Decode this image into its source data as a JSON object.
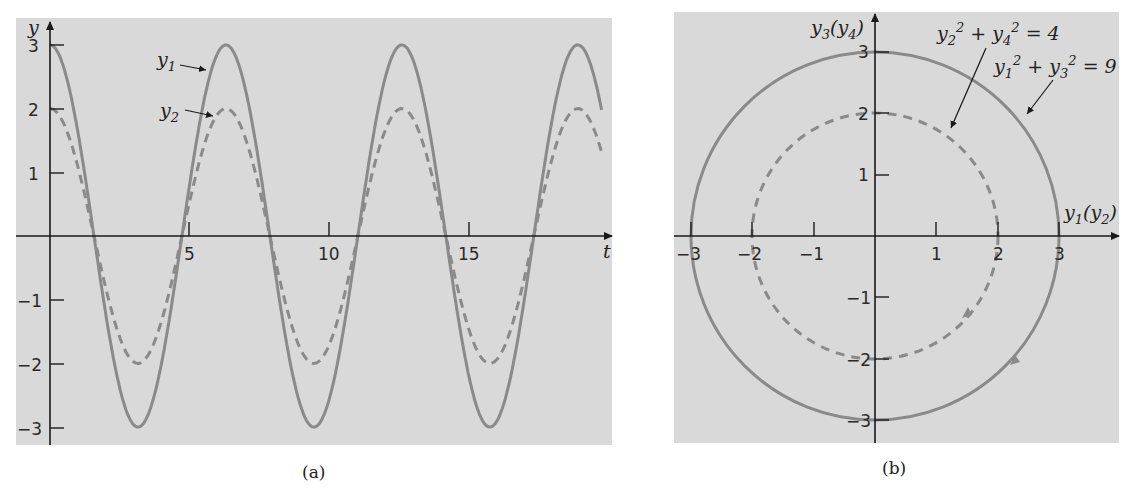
{
  "figure": {
    "captions": {
      "a": "(a)",
      "b": "(b)"
    },
    "colors": {
      "background": "#d9d9d9",
      "curve": "#8a8a8a",
      "axis": "#1a1a1a",
      "text": "#222222"
    }
  },
  "chart_data": [
    {
      "type": "line",
      "panel": "a",
      "title": "",
      "xlabel": "t",
      "ylabel": "y",
      "xlim": [
        0,
        19.7
      ],
      "ylim": [
        -3,
        3
      ],
      "x_ticks": [
        5,
        10,
        15
      ],
      "y_ticks": [
        -3,
        -2,
        -1,
        1,
        2,
        3
      ],
      "grid": false,
      "series": [
        {
          "name": "y1",
          "style": "solid",
          "formula": "3cos(t)",
          "amplitude": 3,
          "x": [
            0,
            1.571,
            3.142,
            4.712,
            6.283,
            7.854,
            9.425,
            10.996,
            12.566,
            14.137,
            15.708,
            17.279,
            18.85
          ],
          "values": [
            3,
            0,
            -3,
            0,
            3,
            0,
            -3,
            0,
            3,
            0,
            -3,
            0,
            3
          ]
        },
        {
          "name": "y2",
          "style": "dashed",
          "formula": "2cos(t)",
          "amplitude": 2,
          "x": [
            0,
            1.571,
            3.142,
            4.712,
            6.283,
            7.854,
            9.425,
            10.996,
            12.566,
            14.137,
            15.708,
            17.279,
            18.85
          ],
          "values": [
            2,
            0,
            -2,
            0,
            2,
            0,
            -2,
            0,
            2,
            0,
            -2,
            0,
            2
          ]
        }
      ],
      "annotations": [
        {
          "text": "y1",
          "points_to": "solid curve near first peak"
        },
        {
          "text": "y2",
          "points_to": "dashed curve near first peak"
        }
      ]
    },
    {
      "type": "line",
      "panel": "b",
      "title": "",
      "xlabel": "y1(y2)",
      "ylabel": "y3(y4)",
      "xlim": [
        -3,
        3
      ],
      "ylim": [
        -3,
        3
      ],
      "x_ticks": [
        -3,
        -2,
        -1,
        1,
        2,
        3
      ],
      "y_ticks": [
        -3,
        -2,
        -1,
        1,
        2,
        3
      ],
      "grid": false,
      "series": [
        {
          "name": "y1^2 + y3^2 = 9",
          "style": "solid",
          "shape": "circle",
          "radius": 3,
          "direction": "clockwise"
        },
        {
          "name": "y2^2 + y4^2 = 4",
          "style": "dashed",
          "shape": "circle",
          "radius": 2,
          "direction": "clockwise"
        }
      ],
      "annotations": [
        {
          "text": "y2^2 + y4^2 = 4",
          "points_to": "dashed circle"
        },
        {
          "text": "y1^2 + y3^2 = 9",
          "points_to": "solid circle"
        }
      ]
    }
  ],
  "labels": {
    "a": {
      "y_axis": "y",
      "t_axis": "t",
      "x_ticks": [
        "5",
        "10",
        "15"
      ],
      "y_ticks": [
        "3",
        "2",
        "1",
        "−1",
        "−2",
        "−3"
      ],
      "y1_base": "y",
      "y1_sub": "1",
      "y2_base": "y",
      "y2_sub": "2"
    },
    "b": {
      "x_axis_base": "y",
      "x_axis_sub": "1",
      "x_axis_paren": "(y",
      "x_axis_paren_sub": "2",
      "x_axis_close": ")",
      "y_axis_base": "y",
      "y_axis_sub": "3",
      "y_axis_paren": "(y",
      "y_axis_paren_sub": "4",
      "y_axis_close": ")",
      "x_ticks": [
        "−3",
        "−2",
        "−1",
        "1",
        "2",
        "3"
      ],
      "y_ticks": [
        "3",
        "2",
        "1",
        "−1",
        "−2",
        "−3"
      ],
      "eq_inner": {
        "a": "y",
        "a_sub": "2",
        "b": "y",
        "b_sub": "4",
        "rhs": "= 4"
      },
      "eq_outer": {
        "a": "y",
        "a_sub": "1",
        "b": "y",
        "b_sub": "3",
        "rhs": "= 9"
      }
    }
  }
}
